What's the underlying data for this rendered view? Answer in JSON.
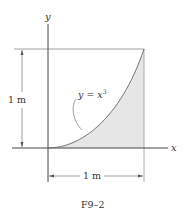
{
  "figure": {
    "caption": "F9–2",
    "axes": {
      "x_label": "x",
      "y_label": "y"
    },
    "curve": {
      "label_prefix": "y = x",
      "label_exponent": "3",
      "equation": "y = x^3"
    },
    "dimensions": {
      "vertical": "1 m",
      "horizontal": "1 m"
    },
    "colors": {
      "line": "#555555",
      "shade": "#e6e6e6",
      "text": "#333333"
    }
  }
}
